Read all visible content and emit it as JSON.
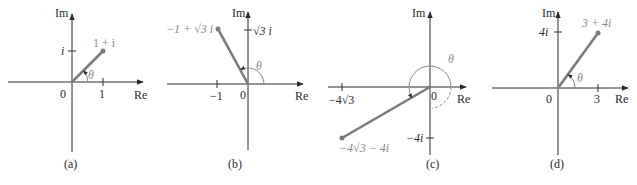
{
  "colors": {
    "axis": "#2a2a2a",
    "vector": "#7a7a7a",
    "label_gray": "#8a8a8a"
  },
  "common": {
    "real_axis_label": "Re",
    "imag_axis_label": "Im",
    "origin_label": "0",
    "angle_label": "θ"
  },
  "panels": [
    {
      "caption": "(a)",
      "point_label": "1 + i",
      "x_tick": "1",
      "y_tick": "i",
      "point": [
        1,
        1
      ]
    },
    {
      "caption": "(b)",
      "point_label": "−1 + √3 i",
      "x_tick": "−1",
      "y_tick": "√3 i",
      "point": [
        -1,
        1.732
      ]
    },
    {
      "caption": "(c)",
      "point_label": "−4√3 − 4i",
      "x_tick": "−4√3",
      "y_tick": "−4i",
      "point": [
        -6.928,
        -4
      ]
    },
    {
      "caption": "(d)",
      "point_label": "3 + 4i",
      "x_tick": "3",
      "y_tick": "4i",
      "point": [
        3,
        4
      ]
    }
  ]
}
